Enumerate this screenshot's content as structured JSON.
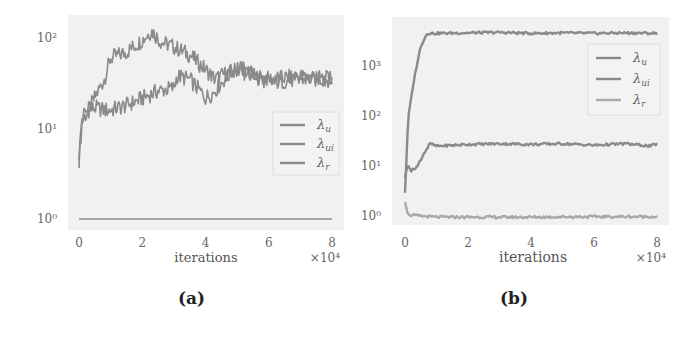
{
  "chart_data": [
    {
      "id": "a",
      "type": "line",
      "caption": "(a)",
      "xlabel": "iterations",
      "x_multiplier": "×10⁴",
      "ylabel": "",
      "yscale": "log",
      "xlim": [
        0,
        8
      ],
      "ylim_log10": [
        0,
        2.15
      ],
      "xticks": [
        "0",
        "2",
        "4",
        "6",
        "8"
      ],
      "yticks": [
        "10⁰",
        "10¹",
        "10²"
      ],
      "grid": false,
      "legend_position": "center right",
      "series": [
        {
          "name": "λ_u",
          "label": "λ",
          "sub": "u",
          "x": [
            0,
            0.1,
            0.3,
            0.5,
            0.8,
            1.0,
            1.5,
            2.0,
            2.3,
            2.6,
            3.0,
            3.5,
            4.0,
            4.3,
            4.6,
            5.0,
            5.5,
            6.0,
            7.0,
            8.0
          ],
          "values": [
            4.5,
            12,
            16,
            22,
            35,
            60,
            70,
            95,
            120,
            90,
            80,
            65,
            45,
            35,
            40,
            45,
            38,
            35,
            38,
            35
          ]
        },
        {
          "name": "λ_ui",
          "label": "λ",
          "sub": "ui",
          "x": [
            0,
            0.1,
            0.3,
            0.5,
            0.8,
            1.0,
            1.5,
            1.8,
            2.5,
            3.0,
            3.1,
            3.5,
            4.0,
            4.2,
            4.6,
            5.0,
            5.5,
            6.0,
            7.0,
            8.0
          ],
          "values": [
            5,
            14,
            16,
            17,
            16,
            16,
            18,
            20,
            26,
            28,
            38,
            35,
            22,
            24,
            35,
            48,
            40,
            32,
            35,
            35
          ]
        },
        {
          "name": "λ_r",
          "label": "λ",
          "sub": "r",
          "x": [
            0,
            8
          ],
          "values": [
            1,
            1
          ]
        }
      ]
    },
    {
      "id": "b",
      "type": "line",
      "caption": "(b)",
      "xlabel": "iterations",
      "x_multiplier": "×10⁴",
      "ylabel": "",
      "yscale": "log",
      "xlim": [
        0,
        8
      ],
      "ylim_log10": [
        -0.05,
        3.8
      ],
      "xticks": [
        "0",
        "2",
        "4",
        "6",
        "8"
      ],
      "yticks": [
        "10⁰",
        "10¹",
        "10²",
        "10³"
      ],
      "grid": false,
      "legend_position": "upper right",
      "series": [
        {
          "name": "λ_u",
          "label": "λ",
          "sub": "u",
          "x": [
            0,
            0.1,
            0.3,
            0.5,
            0.7,
            1.0,
            2.0,
            3.0,
            4.0,
            5.0,
            6.0,
            7.0,
            8.0
          ],
          "values": [
            3,
            90,
            600,
            2500,
            4500,
            4500,
            4600,
            4700,
            4500,
            4600,
            4500,
            4600,
            4500
          ]
        },
        {
          "name": "λ_ui",
          "label": "λ",
          "sub": "ui",
          "x": [
            0,
            0.1,
            0.2,
            0.4,
            0.6,
            0.8,
            1.0,
            2.0,
            3.0,
            4.0,
            5.0,
            6.0,
            7.0,
            7.8,
            8.0
          ],
          "values": [
            6,
            11,
            8,
            10,
            18,
            28,
            25,
            27,
            28,
            27,
            28,
            26,
            28,
            25,
            28
          ]
        },
        {
          "name": "λ_r",
          "label": "λ",
          "sub": "r",
          "x": [
            0,
            0.1,
            0.5,
            1.0,
            2.0,
            4.0,
            6.0,
            8.0
          ],
          "values": [
            2,
            1.05,
            1.0,
            0.95,
            0.95,
            0.95,
            0.97,
            0.97
          ]
        }
      ]
    }
  ],
  "colors": {
    "line": "#8a8a8a",
    "line_light": "#a8a8a8",
    "plot_bg": "#f1f1f1",
    "legend_border": "#dddddd"
  }
}
